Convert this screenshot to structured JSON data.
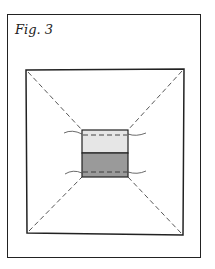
{
  "figure": {
    "caption": "Fig. 3",
    "colors": {
      "stroke": "#222222",
      "light_panel": "#e6e6e6",
      "dark_panel": "#9a9a9a",
      "background": "#ffffff"
    }
  }
}
